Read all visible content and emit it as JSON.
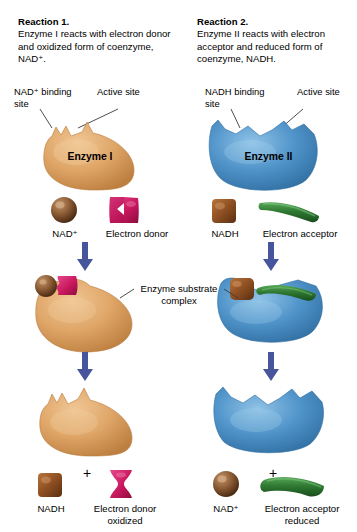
{
  "figure": {
    "background": "#ffffff",
    "arrow_color": "#46559c",
    "enzyme1_color": "#dba264",
    "enzyme2_color": "#4f93c9",
    "nad_sphere_color": "#8a5a33",
    "nadh_cube_color": "#8d4f22",
    "electron_donor_color": "#c9185e",
    "electron_acceptor_color": "#2f7a33",
    "leader_line_color": "#3a3a3a"
  },
  "reactions": {
    "left": {
      "title": "Reaction 1.",
      "description": "Enzyme I reacts with electron donor and oxidized form of coenzyme, NAD⁺.",
      "binding_site_label": "NAD⁺ binding site",
      "active_site_label": "Active site",
      "enzyme_label": "Enzyme I",
      "reactants": [
        {
          "name": "NAD⁺",
          "shape": "sphere"
        },
        {
          "name": "Electron donor",
          "shape": "notched-block"
        }
      ],
      "products": [
        {
          "name": "NADH",
          "shape": "cube"
        },
        {
          "name": "Electron donor oxidized",
          "shape": "hourglass"
        }
      ]
    },
    "right": {
      "title": "Reaction 2.",
      "description": "Enzyme II reacts with electron acceptor and reduced form of coenzyme, NADH.",
      "binding_site_label": "NADH binding site",
      "active_site_label": "Active site",
      "enzyme_label": "Enzyme II",
      "reactants": [
        {
          "name": "NADH",
          "shape": "cube"
        },
        {
          "name": "Electron acceptor",
          "shape": "curved-bar"
        }
      ],
      "products": [
        {
          "name": "NAD⁺",
          "shape": "sphere"
        },
        {
          "name": "Electron acceptor reduced",
          "shape": "curved-bar"
        }
      ]
    },
    "center_label": "Enzyme substrate complex",
    "plus_symbol": "+"
  }
}
